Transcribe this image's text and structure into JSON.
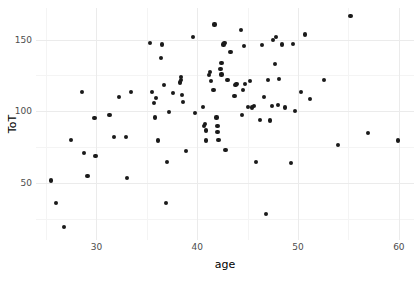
{
  "chart_data": {
    "type": "scatter",
    "title": "",
    "xlabel": "age",
    "ylabel": "ToT",
    "xlim": [
      24.0,
      61.5
    ],
    "ylim": [
      10.0,
      172.0
    ],
    "xticks": [
      30,
      40,
      50,
      60
    ],
    "xticklabels": [
      "30",
      "40",
      "50",
      "60"
    ],
    "yticks": [
      50,
      100,
      150
    ],
    "yticklabels": [
      "50",
      "100",
      "150"
    ],
    "x_minor_ticks": [
      25,
      35,
      45,
      55
    ],
    "y_minor_ticks": [
      25,
      75,
      125,
      150
    ],
    "grid": true,
    "legend": null,
    "point_color": "#1a1a1a",
    "point_size": 4.2,
    "panel_background": "#ffffff",
    "gridline_color": "#ebebeb",
    "minor_gridline_color": "#f4f4f4",
    "points": [
      [
        25.5,
        51.5
      ],
      [
        26.0,
        36.0
      ],
      [
        26.8,
        19.0
      ],
      [
        27.5,
        80.0
      ],
      [
        28.6,
        113.5
      ],
      [
        28.8,
        71.0
      ],
      [
        29.1,
        54.5
      ],
      [
        29.9,
        68.5
      ],
      [
        29.8,
        95.0
      ],
      [
        31.3,
        97.5
      ],
      [
        31.7,
        82.0
      ],
      [
        32.2,
        110.0
      ],
      [
        32.9,
        82.0
      ],
      [
        33.0,
        53.5
      ],
      [
        33.4,
        113.5
      ],
      [
        35.3,
        147.5
      ],
      [
        35.5,
        113.5
      ],
      [
        35.7,
        105.5
      ],
      [
        35.8,
        95.5
      ],
      [
        35.9,
        109.0
      ],
      [
        36.1,
        79.5
      ],
      [
        36.4,
        137.0
      ],
      [
        36.5,
        146.5
      ],
      [
        36.7,
        118.5
      ],
      [
        36.9,
        36.0
      ],
      [
        37.0,
        64.5
      ],
      [
        37.2,
        99.5
      ],
      [
        37.6,
        112.5
      ],
      [
        38.3,
        120.0
      ],
      [
        38.4,
        124.0
      ],
      [
        38.4,
        121.5
      ],
      [
        38.5,
        111.5
      ],
      [
        38.6,
        106.5
      ],
      [
        38.9,
        72.0
      ],
      [
        39.6,
        151.5
      ],
      [
        39.8,
        98.5
      ],
      [
        40.6,
        103.0
      ],
      [
        40.7,
        89.5
      ],
      [
        40.8,
        91.0
      ],
      [
        40.9,
        86.5
      ],
      [
        40.9,
        79.5
      ],
      [
        41.2,
        125.0
      ],
      [
        41.3,
        127.5
      ],
      [
        41.4,
        121.0
      ],
      [
        41.6,
        115.0
      ],
      [
        41.7,
        160.5
      ],
      [
        41.9,
        95.5
      ],
      [
        42.0,
        89.5
      ],
      [
        42.0,
        85.5
      ],
      [
        42.1,
        80.0
      ],
      [
        42.3,
        129.5
      ],
      [
        42.4,
        133.5
      ],
      [
        42.4,
        125.5
      ],
      [
        42.6,
        146.5
      ],
      [
        42.7,
        147.5
      ],
      [
        42.8,
        73.0
      ],
      [
        43.0,
        122.0
      ],
      [
        43.3,
        141.5
      ],
      [
        43.7,
        110.5
      ],
      [
        43.8,
        118.5
      ],
      [
        43.9,
        119.0
      ],
      [
        44.3,
        156.5
      ],
      [
        44.4,
        97.5
      ],
      [
        44.5,
        114.5
      ],
      [
        44.6,
        145.5
      ],
      [
        44.7,
        119.0
      ],
      [
        45.0,
        103.0
      ],
      [
        45.2,
        121.0
      ],
      [
        45.4,
        102.5
      ],
      [
        45.6,
        103.5
      ],
      [
        45.8,
        64.5
      ],
      [
        46.2,
        94.0
      ],
      [
        46.4,
        146.0
      ],
      [
        46.6,
        110.0
      ],
      [
        46.8,
        28.0
      ],
      [
        47.0,
        122.0
      ],
      [
        47.2,
        93.5
      ],
      [
        47.4,
        103.5
      ],
      [
        47.5,
        149.5
      ],
      [
        47.7,
        133.0
      ],
      [
        47.8,
        151.5
      ],
      [
        48.0,
        104.5
      ],
      [
        48.1,
        122.5
      ],
      [
        48.4,
        146.5
      ],
      [
        48.7,
        102.5
      ],
      [
        49.3,
        63.5
      ],
      [
        49.5,
        147.0
      ],
      [
        49.7,
        100.0
      ],
      [
        50.3,
        113.5
      ],
      [
        50.7,
        153.5
      ],
      [
        51.2,
        108.5
      ],
      [
        52.6,
        122.0
      ],
      [
        54.0,
        76.5
      ],
      [
        55.2,
        166.5
      ],
      [
        56.9,
        84.5
      ],
      [
        59.9,
        79.5
      ]
    ]
  }
}
